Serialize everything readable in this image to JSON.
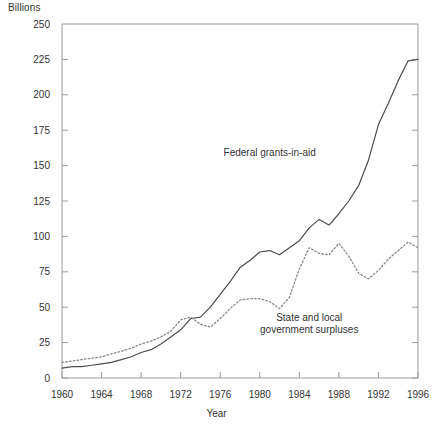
{
  "chart_data": {
    "type": "line",
    "title": "",
    "xlabel": "Year",
    "ylabel": "Billions",
    "ylim": [
      0,
      250
    ],
    "xlim": [
      1960,
      1996
    ],
    "ytick_step": 25,
    "xtick_step": 4,
    "grid": false,
    "legend_position": "inline-annotation",
    "yticks": [
      "0",
      "25",
      "50",
      "75",
      "100",
      "125",
      "150",
      "175",
      "200",
      "225",
      "250"
    ],
    "xticks": [
      "1960",
      "1964",
      "1968",
      "1972",
      "1976",
      "1980",
      "1984",
      "1988",
      "1992",
      "1996"
    ],
    "x": [
      1960,
      1961,
      1962,
      1963,
      1964,
      1965,
      1966,
      1967,
      1968,
      1969,
      1970,
      1971,
      1972,
      1973,
      1974,
      1975,
      1976,
      1977,
      1978,
      1979,
      1980,
      1981,
      1982,
      1983,
      1984,
      1985,
      1986,
      1987,
      1988,
      1989,
      1990,
      1991,
      1992,
      1993,
      1994,
      1995,
      1996
    ],
    "series": [
      {
        "name": "Federal grants-in-aid",
        "style": "solid",
        "color": "#4d4d4d",
        "annotation": "Federal grants-in-aid",
        "annotation_x": 1981,
        "annotation_y": 157,
        "values": [
          7,
          8,
          8,
          9,
          10,
          11,
          13,
          15,
          18,
          20,
          24,
          29,
          34,
          42,
          43,
          50,
          59,
          68,
          78,
          83,
          89,
          90,
          87,
          92,
          97,
          106,
          112,
          108,
          116,
          125,
          136,
          154,
          179,
          194,
          210,
          224,
          225
        ]
      },
      {
        "name": "State and local government surpluses",
        "style": "dotted",
        "color": "#888888",
        "annotation": "State and local\ngovernment surpluses",
        "annotation_x": 1985,
        "annotation_y": 40,
        "values": [
          11,
          12,
          13,
          14,
          15,
          17,
          19,
          21,
          24,
          26,
          29,
          33,
          41,
          43,
          38,
          36,
          42,
          49,
          55,
          56,
          56,
          54,
          49,
          57,
          77,
          92,
          88,
          87,
          95,
          86,
          74,
          70,
          76,
          84,
          90,
          96,
          92
        ]
      }
    ]
  },
  "axes": {
    "y_unit_label": "Billions",
    "x_axis_title": "Year"
  }
}
